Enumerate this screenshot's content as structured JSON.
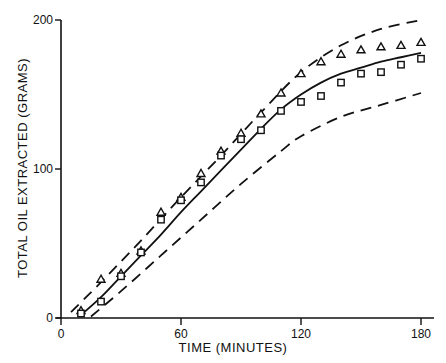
{
  "chart_data": {
    "type": "scatter",
    "title": "",
    "xlabel": "TIME (MINUTES)",
    "ylabel": "TOTAL OIL EXTRACTED (GRAMS)",
    "xlim": [
      0,
      185
    ],
    "ylim": [
      0,
      200
    ],
    "x_ticks": [
      0,
      60,
      120,
      180
    ],
    "y_ticks": [
      0,
      100,
      200
    ],
    "x_tick_labels": [
      "0",
      "60",
      "120",
      "180"
    ],
    "y_tick_labels": [
      "0",
      "100",
      "200"
    ],
    "grid": false,
    "legend": null,
    "series": [
      {
        "name": "triangles",
        "marker": "triangle",
        "x": [
          10,
          20,
          30,
          40,
          50,
          60,
          70,
          80,
          90,
          100,
          110,
          120,
          130,
          140,
          150,
          160,
          170,
          180
        ],
        "values": [
          5,
          26,
          30,
          45,
          71,
          81,
          97,
          112,
          124,
          137,
          151,
          164,
          172,
          177,
          180,
          182,
          183,
          185
        ]
      },
      {
        "name": "squares",
        "marker": "square",
        "x": [
          10,
          20,
          30,
          40,
          50,
          60,
          70,
          80,
          90,
          100,
          110,
          120,
          130,
          140,
          150,
          160,
          170,
          180
        ],
        "values": [
          3,
          11,
          28,
          44,
          66,
          79,
          91,
          109,
          120,
          126,
          139,
          145,
          149,
          158,
          164,
          165,
          170,
          174
        ]
      },
      {
        "name": "model fit",
        "style": "solid line",
        "x": [
          10,
          20,
          30,
          40,
          50,
          60,
          70,
          80,
          90,
          100,
          110,
          120,
          130,
          140,
          150,
          160,
          170,
          180
        ],
        "values": [
          2,
          14,
          28,
          42,
          56,
          71,
          85,
          99,
          113,
          127,
          140,
          150,
          158,
          164,
          168,
          172,
          175,
          178
        ]
      },
      {
        "name": "upper bound",
        "style": "dashed line",
        "x": [
          5,
          20,
          40,
          60,
          80,
          100,
          120,
          140,
          160,
          180
        ],
        "values": [
          4,
          24,
          52,
          81,
          109,
          138,
          165,
          183,
          194,
          200
        ]
      },
      {
        "name": "lower bound",
        "style": "dashed line",
        "x": [
          15,
          30,
          50,
          70,
          90,
          110,
          120,
          140,
          160,
          180
        ],
        "values": [
          1,
          18,
          42,
          66,
          90,
          112,
          122,
          135,
          143,
          151
        ]
      }
    ]
  }
}
